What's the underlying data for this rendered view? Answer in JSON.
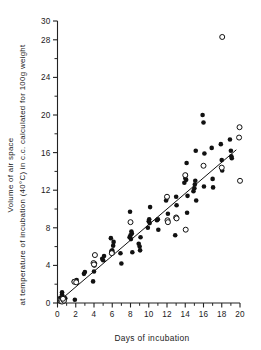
{
  "chart_data": {
    "type": "scatter",
    "title": "",
    "xlabel": "Days of incubation",
    "ylabel_line1": "Volume of air space",
    "ylabel_line2": "at temperature of incubation (40°C) in c.c. calculated for 100g weight",
    "ylabel": "Volume of air space at temperature of incubation (40°C) in c.c. calculated for 100g weight",
    "xlim": [
      0,
      20
    ],
    "ylim": [
      0,
      30
    ],
    "x_ticks": [
      0,
      2,
      4,
      6,
      8,
      10,
      12,
      14,
      16,
      18,
      20
    ],
    "x_tick_labels": [
      "0",
      "2",
      "4",
      "6",
      "8",
      "10",
      "12",
      "14",
      "16",
      "18",
      "20"
    ],
    "x_minor_ticks": [
      1,
      3,
      5,
      7,
      9,
      11,
      13,
      15,
      17,
      19
    ],
    "y_ticks": [
      0,
      4,
      8,
      12,
      16,
      20,
      24,
      28,
      30
    ],
    "y_tick_labels": [
      "0",
      "4",
      "8",
      "12",
      "16",
      "20",
      "24",
      "28",
      "30"
    ],
    "y_minor_ticks": [
      2,
      6,
      10,
      14,
      18,
      22,
      26
    ],
    "grid": false,
    "legend": false,
    "legend_position": "none",
    "series": [
      {
        "name": "filled",
        "marker": "filled-circle",
        "color": "#111111",
        "points": [
          [
            0.3,
            0.55
          ],
          [
            0.4,
            0.25
          ],
          [
            0.5,
            0.9
          ],
          [
            0.55,
            0.35
          ],
          [
            0.65,
            0.6
          ],
          [
            0.75,
            0.2
          ],
          [
            0.85,
            0.5
          ],
          [
            0.5,
            1.15
          ],
          [
            1.9,
            0.35
          ],
          [
            1.8,
            2.3
          ],
          [
            2.0,
            2.35
          ],
          [
            2.1,
            2.45
          ],
          [
            2.9,
            3.1
          ],
          [
            3.0,
            3.3
          ],
          [
            3.9,
            2.3
          ],
          [
            4.0,
            3.35
          ],
          [
            4.05,
            4.0
          ],
          [
            4.1,
            4.2
          ],
          [
            4.9,
            4.7
          ],
          [
            5.0,
            4.55
          ],
          [
            5.1,
            5.0
          ],
          [
            5.9,
            5.5
          ],
          [
            6.0,
            5.6
          ],
          [
            6.05,
            5.35
          ],
          [
            6.1,
            6.1
          ],
          [
            6.15,
            6.5
          ],
          [
            5.85,
            6.9
          ],
          [
            6.9,
            5.3
          ],
          [
            7.0,
            4.2
          ],
          [
            7.9,
            7.0
          ],
          [
            8.0,
            7.2
          ],
          [
            8.05,
            6.8
          ],
          [
            8.1,
            7.6
          ],
          [
            8.15,
            7.4
          ],
          [
            7.95,
            9.7
          ],
          [
            8.2,
            5.4
          ],
          [
            8.9,
            6.3
          ],
          [
            9.0,
            6.0
          ],
          [
            9.05,
            5.6
          ],
          [
            9.1,
            7.0
          ],
          [
            9.9,
            8.0
          ],
          [
            10.0,
            8.7
          ],
          [
            10.05,
            8.9
          ],
          [
            10.1,
            8.5
          ],
          [
            10.15,
            10.2
          ],
          [
            10.9,
            8.8
          ],
          [
            11.0,
            8.9
          ],
          [
            11.05,
            7.8
          ],
          [
            11.9,
            10.9
          ],
          [
            12.0,
            11.2
          ],
          [
            12.05,
            8.8
          ],
          [
            12.1,
            9.5
          ],
          [
            12.9,
            7.2
          ],
          [
            13.0,
            11.3
          ],
          [
            13.05,
            10.4
          ],
          [
            13.9,
            12.8
          ],
          [
            14.0,
            13.3
          ],
          [
            14.05,
            13.6
          ],
          [
            14.1,
            13.1
          ],
          [
            14.15,
            14.9
          ],
          [
            14.2,
            9.6
          ],
          [
            14.25,
            11.4
          ],
          [
            14.9,
            11.9
          ],
          [
            15.0,
            12.2
          ],
          [
            15.05,
            12.6
          ],
          [
            15.1,
            13.0
          ],
          [
            15.15,
            16.2
          ],
          [
            15.2,
            10.9
          ],
          [
            15.9,
            20.0
          ],
          [
            16.0,
            19.2
          ],
          [
            16.05,
            12.4
          ],
          [
            16.1,
            15.9
          ],
          [
            16.9,
            16.5
          ],
          [
            17.0,
            13.2
          ],
          [
            17.05,
            12.3
          ],
          [
            17.9,
            16.9
          ],
          [
            18.0,
            15.2
          ],
          [
            18.05,
            14.1
          ],
          [
            18.9,
            17.4
          ],
          [
            19.0,
            16.2
          ],
          [
            19.05,
            15.6
          ],
          [
            19.1,
            15.4
          ]
        ]
      },
      {
        "name": "open",
        "marker": "open-circle",
        "color": "#ffffff",
        "points": [
          [
            0.35,
            0.2
          ],
          [
            0.5,
            0.15
          ],
          [
            0.7,
            0.25
          ],
          [
            0.6,
            0.45
          ],
          [
            1.85,
            2.25
          ],
          [
            2.05,
            2.2
          ],
          [
            3.95,
            4.25
          ],
          [
            4.0,
            4.1
          ],
          [
            4.1,
            5.1
          ],
          [
            5.95,
            5.3
          ],
          [
            8.0,
            8.6
          ],
          [
            12.0,
            11.3
          ],
          [
            12.05,
            8.8
          ],
          [
            12.1,
            8.6
          ],
          [
            13.0,
            9.1
          ],
          [
            13.05,
            9.0
          ],
          [
            14.0,
            13.6
          ],
          [
            14.05,
            7.8
          ],
          [
            16.0,
            14.6
          ],
          [
            18.0,
            14.4
          ],
          [
            18.05,
            28.3
          ],
          [
            19.95,
            18.7
          ],
          [
            19.9,
            17.6
          ],
          [
            20.0,
            13.0
          ]
        ]
      }
    ],
    "fit_line": {
      "name": "regression-line",
      "x_start": 0.3,
      "y_start": 0.3,
      "x_end": 19.6,
      "y_end": 16.3
    }
  },
  "figure": {
    "background": "#ffffff",
    "foreground": "#111111"
  }
}
